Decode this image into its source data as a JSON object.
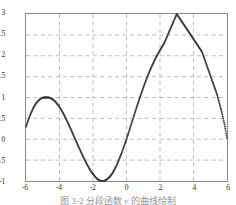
{
  "figure": {
    "caption": "图 3-2   分段函数 y 的曲线绘制",
    "caption_visible_note": "clipped"
  },
  "chart_data": {
    "type": "scatter",
    "title": "",
    "xlabel": "",
    "ylabel": "",
    "xlim": [
      -6,
      6
    ],
    "ylim": [
      -1,
      3
    ],
    "xticks": [
      -6,
      -4,
      -2,
      0,
      2,
      4,
      6
    ],
    "xtick_labels": [
      "-6",
      "-4",
      "-2",
      "0",
      "2",
      "4",
      "6"
    ],
    "yticks": [
      -1,
      -0.5,
      0,
      0.5,
      1,
      1.5,
      2,
      2.5,
      3
    ],
    "ytick_labels": [
      "-1",
      "-0.5",
      "0",
      "0.5",
      "1",
      "1.5",
      "2",
      "2.5",
      "3"
    ],
    "grid": true,
    "grid_style": "dashed",
    "grid_color": "#9aa0a6",
    "legend": null,
    "marker": "dot",
    "marker_color": "#3d3d3d",
    "marker_size": 1.9,
    "series": [
      {
        "name": "y",
        "x": [
          -6.0,
          -5.85,
          -5.7,
          -5.55,
          -5.4,
          -5.25,
          -5.1,
          -4.95,
          -4.8,
          -4.65,
          -4.5,
          -4.35,
          -4.2,
          -4.05,
          -3.9,
          -3.75,
          -3.6,
          -3.45,
          -3.3,
          -3.15,
          -3.0,
          -2.85,
          -2.7,
          -2.55,
          -2.4,
          -2.25,
          -2.1,
          -1.95,
          -1.8,
          -1.65,
          -1.5,
          -1.35,
          -1.2,
          -1.05,
          -0.9,
          -0.75,
          -0.6,
          -0.45,
          -0.3,
          -0.15,
          0.0,
          0.15,
          0.3,
          0.45,
          0.6,
          0.75,
          0.9,
          1.05,
          1.2,
          1.35,
          1.5,
          1.65,
          1.8,
          1.95,
          2.1,
          2.25,
          2.4,
          2.55,
          2.7,
          2.85,
          3.0,
          3.15,
          3.3,
          3.45,
          3.6,
          3.75,
          3.9,
          4.05,
          4.2,
          4.35,
          4.5,
          4.65,
          4.8,
          4.95,
          5.1,
          5.25,
          5.4,
          5.55,
          5.7,
          5.85,
          6.0
        ],
        "y": [
          0.3,
          0.48,
          0.63,
          0.76,
          0.86,
          0.93,
          0.98,
          1.0,
          1.0,
          1.0,
          0.98,
          0.94,
          0.88,
          0.8,
          0.71,
          0.6,
          0.48,
          0.35,
          0.22,
          0.08,
          -0.05,
          -0.19,
          -0.32,
          -0.45,
          -0.57,
          -0.68,
          -0.78,
          -0.86,
          -0.93,
          -0.98,
          -1.0,
          -1.0,
          -0.97,
          -0.92,
          -0.85,
          -0.75,
          -0.63,
          -0.49,
          -0.34,
          -0.17,
          0.0,
          0.19,
          0.38,
          0.57,
          0.76,
          0.94,
          1.12,
          1.29,
          1.45,
          1.6,
          1.74,
          1.87,
          1.99,
          2.1,
          2.2,
          2.3,
          2.44,
          2.58,
          2.72,
          2.86,
          3.0,
          2.91,
          2.82,
          2.73,
          2.64,
          2.55,
          2.46,
          2.37,
          2.28,
          2.19,
          2.1,
          1.93,
          1.76,
          1.59,
          1.42,
          1.25,
          1.08,
          0.86,
          0.63,
          0.36,
          0.03
        ]
      }
    ],
    "annotations": {
      "local_max_1": {
        "x": -4.7,
        "y": 1.0
      },
      "local_min_1": {
        "x": -1.6,
        "y": -1.0
      },
      "global_max": {
        "x": 3.0,
        "y": 3.0
      },
      "left_endpoint": {
        "x": -6,
        "y": 0.3
      },
      "right_endpoint": {
        "x": 6,
        "y": 0.0
      }
    }
  }
}
